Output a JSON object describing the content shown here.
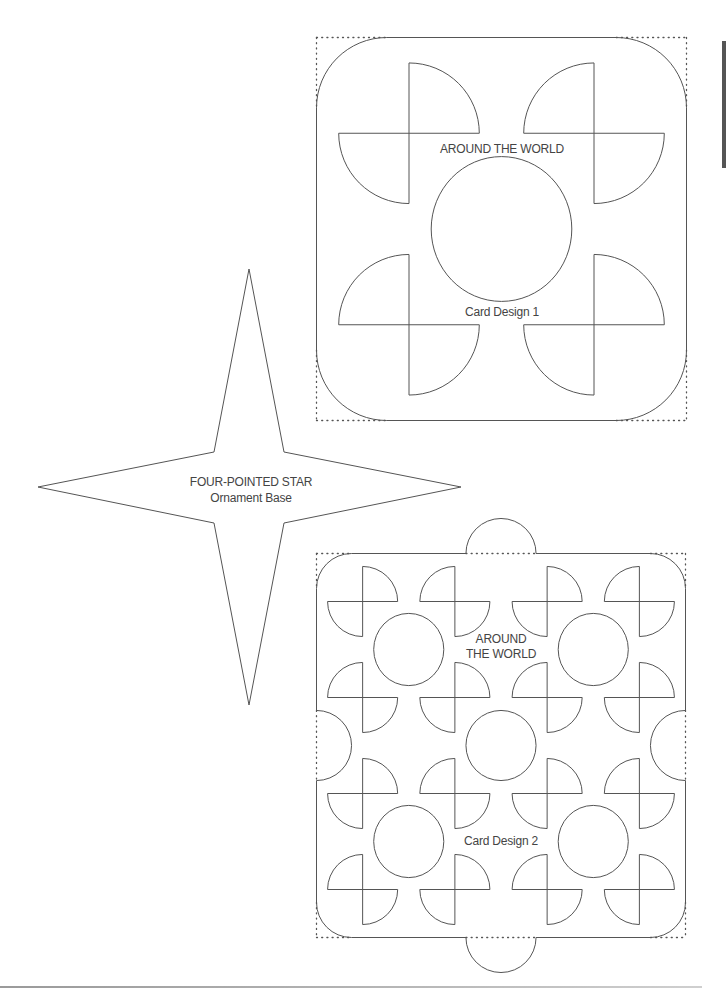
{
  "page": {
    "width": 726,
    "height": 991,
    "line_color": "#555555",
    "dot_color": "#555555",
    "text_color": "#444444",
    "side_tab_color": "#555555"
  },
  "star": {
    "name": "four-pointed-star",
    "title": "FOUR-POINTED STAR",
    "subtitle": "Ornament Base",
    "points": [
      [
        249,
        269
      ],
      [
        284,
        452
      ],
      [
        461,
        487
      ],
      [
        284,
        523
      ],
      [
        249,
        705
      ],
      [
        214,
        523
      ],
      [
        38,
        487
      ],
      [
        214,
        452
      ]
    ],
    "label_x": 251,
    "title_y": 475,
    "subtitle_y": 491
  },
  "cards": [
    {
      "name": "card-design-1",
      "title": "AROUND THE WORLD",
      "title_lines": [
        "AROUND THE WORLD"
      ],
      "caption": "Card Design 1",
      "frame": {
        "x": 316.5,
        "y": 37.5,
        "w": 370,
        "h": 383
      },
      "tiles": 1,
      "title_pos": {
        "x": 502,
        "y": 142
      },
      "caption_pos": {
        "x": 502,
        "y": 305
      }
    },
    {
      "name": "card-design-2",
      "title": "AROUND THE WORLD",
      "title_lines": [
        "AROUND",
        "THE WORLD"
      ],
      "caption": "Card Design 2",
      "frame": {
        "x": 316.5,
        "y": 553.5,
        "w": 369,
        "h": 384
      },
      "tiles": 2,
      "title_pos": {
        "x": 501,
        "y": 632
      },
      "caption_pos": {
        "x": 501,
        "y": 834
      }
    }
  ],
  "decor": {
    "side_tab": "section-tab",
    "footer_rule": "footer-rule"
  }
}
